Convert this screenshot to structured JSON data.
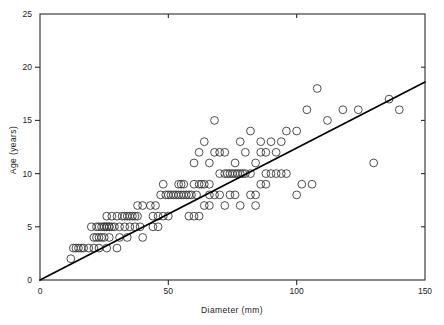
{
  "figure": {
    "background": "#ffffff",
    "axis_color": "#2b2b2b",
    "marker_color": "#3a3a3a",
    "line_color": "#000000",
    "plot_box": {
      "left": 40,
      "top": 14,
      "right": 425,
      "bottom": 280
    }
  },
  "chart_data": {
    "type": "scatter",
    "title": "",
    "subtitle": "",
    "xlabel": "Diameter (mm)",
    "ylabel": "Age (years)",
    "xlim": [
      0,
      150
    ],
    "ylim": [
      0,
      25
    ],
    "xticks": [
      0,
      50,
      100,
      150
    ],
    "yticks": [
      0,
      5,
      10,
      15,
      20,
      25
    ],
    "xtick_labels": [
      "0",
      "50",
      "100",
      "150"
    ],
    "ytick_labels": [
      "0",
      "5",
      "10",
      "15",
      "20",
      "25"
    ],
    "grid": false,
    "legend": null,
    "legend_position": "none",
    "marker": "open-circle",
    "marker_size": 5,
    "annotations": [],
    "series": [
      {
        "name": "Tree samples",
        "type": "scatter",
        "points": [
          [
            12,
            2
          ],
          [
            13,
            3
          ],
          [
            15,
            3
          ],
          [
            17,
            3
          ],
          [
            19,
            3
          ],
          [
            21,
            3
          ],
          [
            23,
            3
          ],
          [
            14,
            3
          ],
          [
            16,
            3
          ],
          [
            21,
            4
          ],
          [
            23,
            4
          ],
          [
            25,
            4
          ],
          [
            27,
            4
          ],
          [
            31,
            4
          ],
          [
            22,
            4
          ],
          [
            24,
            4
          ],
          [
            20,
            5
          ],
          [
            22,
            5
          ],
          [
            24,
            5
          ],
          [
            25,
            5
          ],
          [
            26,
            5
          ],
          [
            27,
            5
          ],
          [
            28,
            5
          ],
          [
            29,
            5
          ],
          [
            31,
            5
          ],
          [
            33,
            5
          ],
          [
            35,
            5
          ],
          [
            37,
            5
          ],
          [
            39,
            5
          ],
          [
            23,
            5
          ],
          [
            25,
            5
          ],
          [
            26,
            5
          ],
          [
            27,
            5
          ],
          [
            26,
            6
          ],
          [
            28,
            6
          ],
          [
            30,
            6
          ],
          [
            32,
            6
          ],
          [
            34,
            6
          ],
          [
            36,
            6
          ],
          [
            38,
            6
          ],
          [
            33,
            6
          ],
          [
            35,
            6
          ],
          [
            37,
            6
          ],
          [
            44,
            6
          ],
          [
            46,
            6
          ],
          [
            48,
            6
          ],
          [
            50,
            6
          ],
          [
            40,
            7
          ],
          [
            43,
            7
          ],
          [
            45,
            7
          ],
          [
            38,
            7
          ],
          [
            47,
            8
          ],
          [
            49,
            8
          ],
          [
            51,
            8
          ],
          [
            53,
            8
          ],
          [
            55,
            8
          ],
          [
            57,
            8
          ],
          [
            59,
            8
          ],
          [
            61,
            8
          ],
          [
            50,
            8
          ],
          [
            52,
            8
          ],
          [
            54,
            8
          ],
          [
            56,
            8
          ],
          [
            58,
            8
          ],
          [
            66,
            8
          ],
          [
            68,
            8
          ],
          [
            70,
            8
          ],
          [
            74,
            8
          ],
          [
            76,
            8
          ],
          [
            82,
            8
          ],
          [
            84,
            8
          ],
          [
            72,
            7
          ],
          [
            78,
            7
          ],
          [
            84,
            7
          ],
          [
            48,
            9
          ],
          [
            54,
            9
          ],
          [
            56,
            9
          ],
          [
            60,
            9
          ],
          [
            62,
            9
          ],
          [
            64,
            9
          ],
          [
            66,
            9
          ],
          [
            55,
            9
          ],
          [
            63,
            9
          ],
          [
            70,
            10
          ],
          [
            72,
            10
          ],
          [
            74,
            10
          ],
          [
            76,
            10
          ],
          [
            78,
            10
          ],
          [
            80,
            10
          ],
          [
            82,
            10
          ],
          [
            73,
            10
          ],
          [
            75,
            10
          ],
          [
            77,
            10
          ],
          [
            79,
            10
          ],
          [
            88,
            10
          ],
          [
            90,
            10
          ],
          [
            94,
            10
          ],
          [
            96,
            10
          ],
          [
            92,
            10
          ],
          [
            60,
            11
          ],
          [
            66,
            11
          ],
          [
            76,
            11
          ],
          [
            84,
            11
          ],
          [
            62,
            12
          ],
          [
            68,
            12
          ],
          [
            70,
            12
          ],
          [
            80,
            12
          ],
          [
            72,
            12
          ],
          [
            86,
            12
          ],
          [
            88,
            12
          ],
          [
            92,
            12
          ],
          [
            64,
            13
          ],
          [
            78,
            13
          ],
          [
            86,
            13
          ],
          [
            94,
            13
          ],
          [
            90,
            13
          ],
          [
            68,
            15
          ],
          [
            82,
            14
          ],
          [
            96,
            14
          ],
          [
            100,
            14
          ],
          [
            104,
            16
          ],
          [
            108,
            18
          ],
          [
            112,
            15
          ],
          [
            118,
            16
          ],
          [
            124,
            16
          ],
          [
            130,
            11
          ],
          [
            136,
            17
          ],
          [
            140,
            16
          ],
          [
            100,
            8
          ],
          [
            102,
            9
          ],
          [
            106,
            9
          ],
          [
            46,
            5
          ],
          [
            44,
            5
          ],
          [
            40,
            4
          ],
          [
            34,
            4
          ],
          [
            30,
            3
          ],
          [
            26,
            3
          ],
          [
            58,
            6
          ],
          [
            60,
            6
          ],
          [
            62,
            6
          ],
          [
            64,
            7
          ],
          [
            66,
            7
          ],
          [
            86,
            9
          ],
          [
            88,
            9
          ]
        ]
      },
      {
        "name": "Fitted regression line",
        "type": "line",
        "x0": 0,
        "y0": 0,
        "x1": 150,
        "y1": 18.6
      }
    ]
  }
}
